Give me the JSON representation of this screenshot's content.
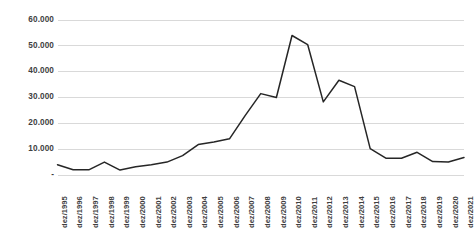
{
  "chart_data": {
    "type": "line",
    "title": "",
    "subtitle": "",
    "xlabel": "",
    "ylabel": "",
    "grid": true,
    "legend": false,
    "legend_position": "none",
    "line_color": "#262626",
    "gridline_color": "#d9d9d9",
    "background_color": "#ffffff",
    "axis_label_color": "#3f3f3f",
    "ylim": [
      0,
      60000
    ],
    "y_ticks": [
      0,
      10000,
      20000,
      30000,
      40000,
      50000,
      60000
    ],
    "y_tick_labels": [
      "-",
      "10.000",
      "20.000",
      "30.000",
      "40.000",
      "50.000",
      "60.000"
    ],
    "categories": [
      "dez/1995",
      "dez/1996",
      "dez/1997",
      "dez/1998",
      "dez/1999",
      "dez/2000",
      "dez/2001",
      "dez/2002",
      "dez/2003",
      "dez/2004",
      "dez/2005",
      "dez/2006",
      "dez/2007",
      "dez/2008",
      "dez/2009",
      "dez/2010",
      "dez/2011",
      "dez/2012",
      "dez/2013",
      "dez/2014",
      "dez/2015",
      "dez/2016",
      "dez/2017",
      "dez/2018",
      "dez/2019",
      "dez/2020",
      "dez/2021"
    ],
    "values": [
      4000,
      2000,
      2000,
      5000,
      1900,
      3200,
      4000,
      5000,
      7500,
      11800,
      12800,
      14000,
      23000,
      31500,
      30000,
      54000,
      50500,
      28300,
      36700,
      34200,
      10200,
      6500,
      6500,
      8800,
      5200,
      5000,
      6800
    ],
    "series": [
      {
        "name": "",
        "values": [
          4000,
          2000,
          2000,
          5000,
          1900,
          3200,
          4000,
          5000,
          7500,
          11800,
          12800,
          14000,
          23000,
          31500,
          30000,
          54000,
          50500,
          28300,
          36700,
          34200,
          10200,
          6500,
          6500,
          8800,
          5200,
          5000,
          6800
        ]
      }
    ]
  }
}
